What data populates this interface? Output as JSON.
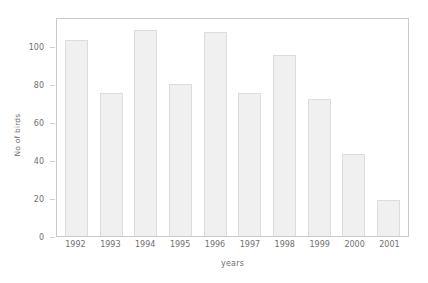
{
  "chart_data": {
    "type": "bar",
    "title": "",
    "xlabel": "years",
    "ylabel": "No of birds",
    "categories": [
      "1992",
      "1993",
      "1994",
      "1995",
      "1996",
      "1997",
      "1998",
      "1999",
      "2000",
      "2001"
    ],
    "values": [
      103,
      75,
      108,
      80,
      107,
      75,
      95,
      72,
      43,
      19
    ],
    "ylim": [
      0,
      115
    ],
    "yticks": [
      0,
      20,
      40,
      60,
      80,
      100
    ],
    "ytick_labels": [
      "0",
      "20",
      "40",
      "60",
      "80",
      "100"
    ],
    "grid": false,
    "legend": null,
    "bar_fill_color": "#f0f0f0",
    "bar_edge_color": "#dcdcdc",
    "axis_color": "#c9c9c9",
    "text_color": "#6f6f6f",
    "background_color": "#ffffff"
  }
}
